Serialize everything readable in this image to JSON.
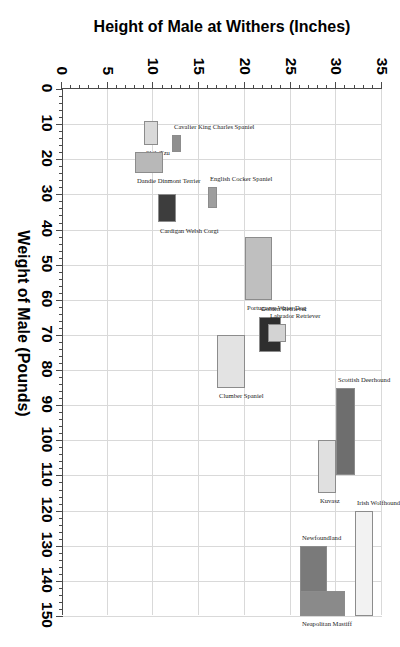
{
  "chart_data": {
    "type": "bar",
    "title": "",
    "xlabel": "Weight of Male (Pounds)",
    "ylabel": "Height of Male at Withers (Inches)",
    "xlim": [
      0,
      150
    ],
    "ylim": [
      0,
      35
    ],
    "xticks": [
      0,
      10,
      20,
      30,
      40,
      50,
      60,
      70,
      80,
      90,
      100,
      110,
      120,
      130,
      140,
      150
    ],
    "yticks": [
      0,
      5,
      10,
      15,
      20,
      25,
      30,
      35
    ],
    "xtick_labels": [
      "0",
      "10",
      "20",
      "30",
      "40",
      "50",
      "60",
      "70",
      "80",
      "90",
      "100",
      "110",
      "120",
      "130",
      "140",
      "150"
    ],
    "ytick_labels": [
      "0",
      "5",
      "10",
      "15",
      "20",
      "25",
      "30",
      "35"
    ],
    "grid": true,
    "legend": "none",
    "minor_ticks": true,
    "note": "Each breed is a rectangle spanning its male weight range (x) and male height-at-withers range (y).",
    "categories": [
      "Shih Tzu",
      "Dandie Dinmont Terrier",
      "Cavalier King Charles Spaniel",
      "English Cocker Spaniel",
      "Cardigan Welsh Corgi",
      "Portuguese Water Dog",
      "Clumber Spaniel",
      "Golden Retriever",
      "Labrador Retriever",
      "Kuvasz",
      "Scottish Deerhound",
      "Newfoundland",
      "Neapolitan Mastiff",
      "Irish Wolfhound"
    ],
    "boxes": [
      {
        "breed": "Shih Tzu",
        "weight_min": 9,
        "weight_max": 16,
        "height_min": 9,
        "height_max": 10.5,
        "color": "#d9d9d9"
      },
      {
        "breed": "Dandie Dinmont Terrier",
        "weight_min": 18,
        "weight_max": 24,
        "height_min": 8,
        "height_max": 11,
        "color": "#b8b8b8"
      },
      {
        "breed": "Cavalier King Charles Spaniel",
        "weight_min": 13,
        "weight_max": 18,
        "height_min": 12,
        "height_max": 13,
        "color": "#8f8f8f"
      },
      {
        "breed": "English Cocker Spaniel",
        "weight_min": 28,
        "weight_max": 34,
        "height_min": 16,
        "height_max": 17,
        "color": "#9e9e9e"
      },
      {
        "breed": "Cardigan Welsh Corgi",
        "weight_min": 30,
        "weight_max": 38,
        "height_min": 10.5,
        "height_max": 12.5,
        "color": "#3d3d3d"
      },
      {
        "breed": "Portuguese Water Dog",
        "weight_min": 42,
        "weight_max": 60,
        "height_min": 20,
        "height_max": 23,
        "color": "#bfbfbf"
      },
      {
        "breed": "Clumber Spaniel",
        "weight_min": 70,
        "weight_max": 85,
        "height_min": 17,
        "height_max": 20,
        "color": "#e3e3e3"
      },
      {
        "breed": "Golden Retriever",
        "weight_min": 65,
        "weight_max": 75,
        "height_min": 21.5,
        "height_max": 24,
        "color": "#2e2e2e"
      },
      {
        "breed": "Labrador Retriever",
        "weight_min": 67,
        "weight_max": 72,
        "height_min": 22.5,
        "height_max": 24.5,
        "color": "#d3d3d3"
      },
      {
        "breed": "Kuvasz",
        "weight_min": 100,
        "weight_max": 115,
        "height_min": 28,
        "height_max": 30,
        "color": "#e0e0e0"
      },
      {
        "breed": "Scottish Deerhound",
        "weight_min": 85,
        "weight_max": 110,
        "height_min": 30,
        "height_max": 32,
        "color": "#6e6e6e"
      },
      {
        "breed": "Newfoundland",
        "weight_min": 130,
        "weight_max": 150,
        "height_min": 26,
        "height_max": 29,
        "color": "#7a7a7a"
      },
      {
        "breed": "Neapolitan Mastiff",
        "weight_min": 143,
        "weight_max": 150,
        "height_min": 26,
        "height_max": 31,
        "color": "#8a8a8a"
      },
      {
        "breed": "Irish Wolfhound",
        "weight_min": 120,
        "weight_max": 150,
        "height_min": 32,
        "height_max": 34,
        "color": "#f2f2f2"
      }
    ]
  }
}
